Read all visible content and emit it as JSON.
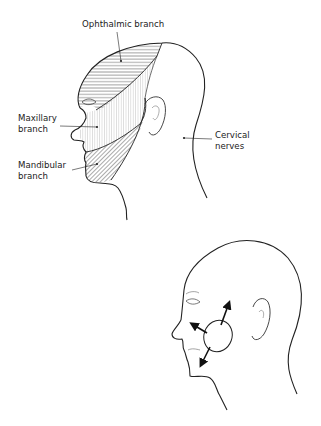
{
  "figure_top": {
    "title": "Sensory distribution of the trigeminal nerve branches",
    "labels": {
      "ophthalmic": "Ophthalmic branch",
      "maxillary_line1": "Maxillary",
      "maxillary_line2": "branch",
      "mandibular_line1": "Mandibular",
      "mandibular_line2": "branch",
      "cervical_line1": "Cervical",
      "cervical_line2": "nerves"
    },
    "regions": [
      {
        "name": "ophthalmic",
        "pattern": "horizontal-hatch"
      },
      {
        "name": "maxillary",
        "pattern": "vertical-stipple"
      },
      {
        "name": "mandibular",
        "pattern": "diagonal-hatch"
      }
    ]
  },
  "figure_bottom": {
    "arrows": [
      "up-right",
      "left-up",
      "down-left"
    ],
    "feature": "parotid-ellipse"
  },
  "colors": {
    "ink": "#222222",
    "background": "#ffffff"
  }
}
